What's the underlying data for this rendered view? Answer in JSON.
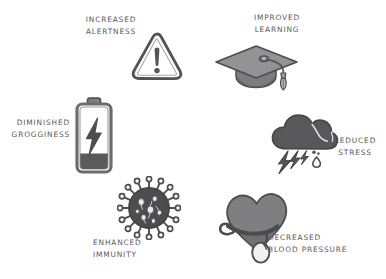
{
  "canvas": {
    "width": 386,
    "height": 279,
    "background": "#ffffff",
    "style": "hand-drawn grayscale infographic"
  },
  "palette": {
    "text": "#58585a",
    "outline_dark": "#4a4a4a",
    "fill_dark": "#4e4e50",
    "fill_mid": "#808080",
    "fill_light": "#9a9a9c",
    "fill_lighter": "#b5b5b7",
    "white": "#ffffff"
  },
  "items": [
    {
      "id": "increased-alertness",
      "icon": "warning-triangle-icon",
      "label_lines": [
        "INCREASED",
        "ALERTNESS"
      ],
      "align": "center"
    },
    {
      "id": "improved-learning",
      "icon": "graduation-cap-icon",
      "label_lines": [
        "IMPROVED",
        "LEARNING"
      ],
      "align": "center"
    },
    {
      "id": "diminished-grogginess",
      "icon": "battery-charging-icon",
      "label_lines": [
        "DIMINISHED",
        "GROGGINESS"
      ],
      "align": "right"
    },
    {
      "id": "reduced-stress",
      "icon": "storm-cloud-icon",
      "label_lines": [
        "REDUCED",
        "STRESS"
      ],
      "align": "center"
    },
    {
      "id": "enhanced-immunity",
      "icon": "virus-icon",
      "label_lines": [
        "ENHANCED",
        "IMMUNITY"
      ],
      "align": "left"
    },
    {
      "id": "decreased-blood-pressure",
      "icon": "heart-blood-pressure-cuff-icon",
      "label_lines": [
        "DECREASED",
        "BLOOD PRESSURE"
      ],
      "align": "left"
    }
  ]
}
